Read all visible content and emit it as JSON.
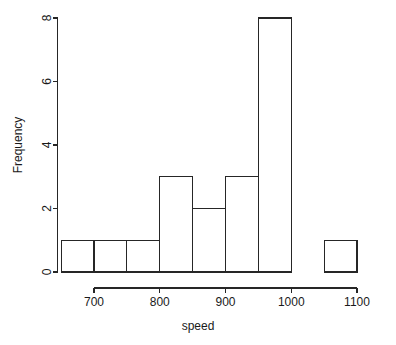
{
  "chart_data": {
    "type": "bar",
    "title": "",
    "subtitle": "",
    "xlabel": "speed",
    "ylabel": "Frequency",
    "grid": false,
    "legend": null,
    "legend_position": "none",
    "bin_width": 50,
    "bin_edges": [
      650,
      700,
      750,
      800,
      850,
      900,
      950,
      1000,
      1050,
      1100
    ],
    "categories": [
      "650-700",
      "700-750",
      "750-800",
      "800-850",
      "850-900",
      "900-950",
      "950-1000",
      "1000-1050",
      "1050-1100"
    ],
    "values": [
      1,
      1,
      1,
      3,
      2,
      3,
      8,
      0,
      1
    ],
    "xlim": [
      650,
      1100
    ],
    "ylim": [
      0,
      8
    ],
    "x_ticks": [
      700,
      800,
      900,
      1000,
      1100
    ],
    "x_tick_labels": [
      "700",
      "800",
      "900",
      "1000",
      "1100"
    ],
    "y_ticks": [
      0,
      2,
      4,
      6,
      8
    ],
    "y_tick_labels": [
      "0",
      "2",
      "4",
      "6",
      "8"
    ],
    "axis_color": "#262626",
    "bar_fill": "#ffffff",
    "bar_stroke": "#262626",
    "background": "#ffffff"
  }
}
